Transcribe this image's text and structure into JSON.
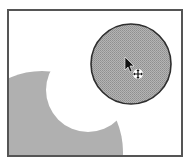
{
  "canvas": {
    "background": "#ffffff",
    "border_color": "#555555"
  },
  "shapes": {
    "selected_circle": {
      "fill": "#a8a8a8",
      "stroke": "#333333",
      "state": "selected"
    },
    "cutout_shape": {
      "fill": "#b0b0b0"
    }
  },
  "cursor": {
    "type": "move-cursor",
    "glyph": "arrow-with-move-crosshair"
  }
}
